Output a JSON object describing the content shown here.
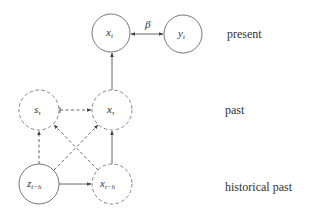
{
  "diagram": {
    "nodes": {
      "x_t": {
        "main": "x",
        "sub": "t",
        "style": "solid"
      },
      "y_t": {
        "main": "y",
        "sub": "t",
        "style": "solid"
      },
      "s_tau": {
        "main": "s",
        "sub": "τ",
        "style": "dashed"
      },
      "x_tau": {
        "main": "x",
        "sub": "τ",
        "style": "dashed"
      },
      "z_th": {
        "main": "z",
        "sub": "t−h",
        "style": "solid"
      },
      "x_th": {
        "main": "x",
        "sub": "t−h",
        "style": "dashed"
      }
    },
    "edges": [
      {
        "from": "x_t",
        "to": "y_t",
        "style": "solid",
        "bidirectional": true,
        "label": "β"
      },
      {
        "from": "x_tau",
        "to": "x_t",
        "style": "solid"
      },
      {
        "from": "s_tau",
        "to": "x_tau",
        "style": "dashed"
      },
      {
        "from": "z_th",
        "to": "s_tau",
        "style": "dashed"
      },
      {
        "from": "z_th",
        "to": "x_tau",
        "style": "dashed"
      },
      {
        "from": "x_th",
        "to": "s_tau",
        "style": "dashed"
      },
      {
        "from": "x_th",
        "to": "x_tau",
        "style": "solid"
      },
      {
        "from": "z_th",
        "to": "x_th",
        "style": "solid"
      }
    ],
    "edge_label_beta": "β",
    "row_labels": {
      "present": "present",
      "past": "past",
      "historical_past": "historical past"
    }
  }
}
